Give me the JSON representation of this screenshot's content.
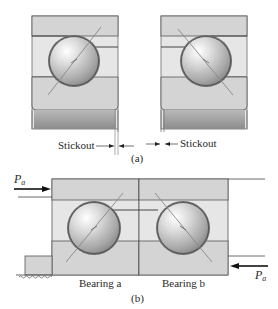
{
  "figure": {
    "part_a": {
      "caption": "(a)",
      "stickout_left_label": "Stickout",
      "stickout_right_label": "Stickout",
      "bearings": [
        {
          "name": "left-bearing",
          "contact_angle_direction": "/"
        },
        {
          "name": "right-bearing",
          "contact_angle_direction": "\\"
        }
      ]
    },
    "part_b": {
      "caption": "(b)",
      "bearing_a_label": "Bearing a",
      "bearing_b_label": "Bearing b",
      "load_left_label": "P",
      "load_left_sub": "a",
      "load_right_label": "P",
      "load_right_sub": "a",
      "arrangement": "face-to-face / paired angular contact"
    }
  },
  "colors": {
    "ring_fill": "#d6d6d6",
    "race_fill": "#e8e8e8",
    "outline": "#555555",
    "bore_dark": "#9a9a9a",
    "ball_light": "#f4f4f4",
    "ball_dark": "#8e8e8e",
    "arrow": "#111111"
  }
}
